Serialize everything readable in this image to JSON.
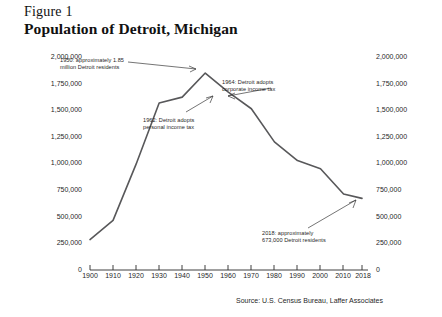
{
  "figure": {
    "label": "Figure 1",
    "title": "Population of Detroit, Michigan",
    "source": "Source: U.S. Census Bureau, Laffer Associates"
  },
  "chart_data": {
    "type": "line",
    "title": "Population of Detroit, Michigan",
    "xlabel": "",
    "ylabel": "",
    "xlim": [
      1900,
      2018
    ],
    "ylim": [
      0,
      2000000
    ],
    "grid": false,
    "legend": "none",
    "x": [
      1900,
      1910,
      1920,
      1930,
      1940,
      1950,
      1960,
      1970,
      1980,
      1990,
      2000,
      2010,
      2018
    ],
    "values": [
      285704,
      465766,
      993678,
      1568662,
      1623452,
      1849568,
      1670144,
      1514063,
      1203339,
      1027974,
      951270,
      713777,
      672662
    ],
    "categories": [
      "1900",
      "1910",
      "1920",
      "1930",
      "1940",
      "1950",
      "1960",
      "1970",
      "1980",
      "1990",
      "2000",
      "2010",
      "2018"
    ],
    "xticks": [
      "1900",
      "1910",
      "1920",
      "1930",
      "1940",
      "1950",
      "1960",
      "1970",
      "1980",
      "1990",
      "2000",
      "2010",
      "2018"
    ],
    "yticks": [
      "0",
      "250,000",
      "500,000",
      "750,000",
      "1,000,000",
      "1,250,000",
      "1,500,000",
      "1,750,000",
      "2,000,000"
    ],
    "ytick_values": [
      0,
      250000,
      500000,
      750000,
      1000000,
      1250000,
      1500000,
      1750000,
      2000000
    ],
    "line_color": "#58585a",
    "annotations": [
      {
        "text": "1950: approximately 1.85\nmillion Detroit residents",
        "x": 1950,
        "y": 1849568
      },
      {
        "text": "1962: Detroit adopts\npersonal income tax",
        "x": 1962,
        "y": 1640000
      },
      {
        "text": "1964: Detroit adopts\ncorporate income tax",
        "x": 1964,
        "y": 1600000
      },
      {
        "text": "2018: approximately\n673,000 Detroit residents",
        "x": 2018,
        "y": 672662
      }
    ]
  },
  "yaxis_left": {
    "labels": [
      "2,000,000",
      "1,750,000",
      "1,500,000",
      "1,250,000",
      "1,000,000",
      "750,000",
      "500,000",
      "250,000",
      "0"
    ]
  },
  "yaxis_right": {
    "labels": [
      "2,000,000",
      "1,750,000",
      "1,500,000",
      "1,250,000",
      "1,000,000",
      "750,000",
      "500,000",
      "250,000",
      "0"
    ]
  },
  "xaxis": {
    "labels": [
      "1900",
      "1910",
      "1920",
      "1930",
      "1940",
      "1950",
      "1960",
      "1970",
      "1980",
      "1990",
      "2000",
      "2010",
      "2018"
    ]
  },
  "annotations": {
    "peak_1950": "1950: approximately 1.85\nmillion Detroit residents",
    "tax_1962": "1962: Detroit adopts\npersonal income tax",
    "tax_1964": "1964: Detroit adopts\ncorporate income tax",
    "end_2018": "2018: approximately\n673,000 Detroit residents"
  }
}
